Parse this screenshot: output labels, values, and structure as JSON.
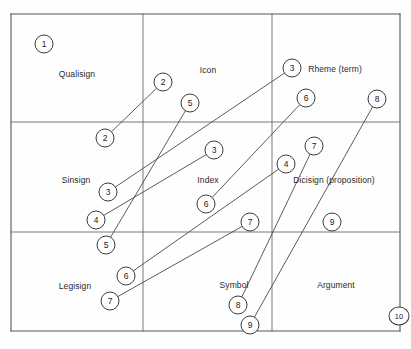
{
  "diagram": {
    "grid": {
      "left": 11,
      "top": 14,
      "right": 400,
      "bottom": 331,
      "v_lines": [
        143,
        272
      ],
      "h_lines": [
        122,
        232
      ],
      "border_color": "#555555",
      "inner_line_color": "#6b6b6b"
    },
    "cells": [
      {
        "name": "qualisign",
        "label": "Qualisign",
        "x": 77,
        "y": 74
      },
      {
        "name": "icon",
        "label": "Icon",
        "x": 208,
        "y": 70
      },
      {
        "name": "rheme",
        "label": "Rheme (term)",
        "x": 335,
        "y": 69
      },
      {
        "name": "sinsign",
        "label": "Sinsign",
        "x": 76,
        "y": 180
      },
      {
        "name": "index",
        "label": "Index",
        "x": 208,
        "y": 180
      },
      {
        "name": "dicisign",
        "label": "Dicisign (proposition)",
        "x": 334,
        "y": 180
      },
      {
        "name": "legisign",
        "label": "Legisign",
        "x": 75,
        "y": 286
      },
      {
        "name": "symbol",
        "label": "Symbol",
        "x": 234,
        "y": 285
      },
      {
        "name": "argument",
        "label": "Argument",
        "x": 336,
        "y": 285
      }
    ],
    "nodes": [
      {
        "id": "n1",
        "label": "1",
        "x": 44,
        "y": 44,
        "wide": false
      },
      {
        "id": "n2a",
        "label": "2",
        "x": 163,
        "y": 82,
        "wide": false
      },
      {
        "id": "n2b",
        "label": "2",
        "x": 105,
        "y": 138,
        "wide": false
      },
      {
        "id": "n3a",
        "label": "3",
        "x": 292,
        "y": 68,
        "wide": false
      },
      {
        "id": "n3b",
        "label": "3",
        "x": 214,
        "y": 150,
        "wide": false
      },
      {
        "id": "n3c",
        "label": "3",
        "x": 108,
        "y": 192,
        "wide": false
      },
      {
        "id": "n4a",
        "label": "4",
        "x": 286,
        "y": 164,
        "wide": false
      },
      {
        "id": "n4b",
        "label": "4",
        "x": 96,
        "y": 220,
        "wide": false
      },
      {
        "id": "n5a",
        "label": "5",
        "x": 190,
        "y": 103,
        "wide": false
      },
      {
        "id": "n5b",
        "label": "5",
        "x": 106,
        "y": 245,
        "wide": false
      },
      {
        "id": "n6a",
        "label": "6",
        "x": 306,
        "y": 98,
        "wide": false
      },
      {
        "id": "n6b",
        "label": "6",
        "x": 206,
        "y": 204,
        "wide": false
      },
      {
        "id": "n6c",
        "label": "6",
        "x": 126,
        "y": 276,
        "wide": false
      },
      {
        "id": "n7a",
        "label": "7",
        "x": 314,
        "y": 146,
        "wide": false
      },
      {
        "id": "n7b",
        "label": "7",
        "x": 250,
        "y": 222,
        "wide": false
      },
      {
        "id": "n7c",
        "label": "7",
        "x": 110,
        "y": 301,
        "wide": false
      },
      {
        "id": "n8a",
        "label": "8",
        "x": 377,
        "y": 99,
        "wide": false
      },
      {
        "id": "n8b",
        "label": "8",
        "x": 238,
        "y": 305,
        "wide": false
      },
      {
        "id": "n9a",
        "label": "9",
        "x": 332,
        "y": 222,
        "wide": false
      },
      {
        "id": "n9b",
        "label": "9",
        "x": 250,
        "y": 325,
        "wide": false
      },
      {
        "id": "n10",
        "label": "10",
        "x": 399,
        "y": 316,
        "wide": true
      }
    ],
    "connectors": [
      {
        "name": "link-2",
        "from": "n2a",
        "to": "n2b"
      },
      {
        "name": "link-3",
        "from": "n3a",
        "to": "n3c"
      },
      {
        "name": "link-3b",
        "from": "n3b",
        "to": "n4b"
      },
      {
        "name": "link-4",
        "from": "n4a",
        "to": "n6c"
      },
      {
        "name": "link-5",
        "from": "n5a",
        "to": "n5b"
      },
      {
        "name": "link-6",
        "from": "n6a",
        "to": "n6b"
      },
      {
        "name": "link-7",
        "from": "n7a",
        "to": "n8b"
      },
      {
        "name": "link-7b",
        "from": "n7b",
        "to": "n7c"
      },
      {
        "name": "link-8",
        "from": "n8a",
        "to": "n9b"
      }
    ]
  }
}
